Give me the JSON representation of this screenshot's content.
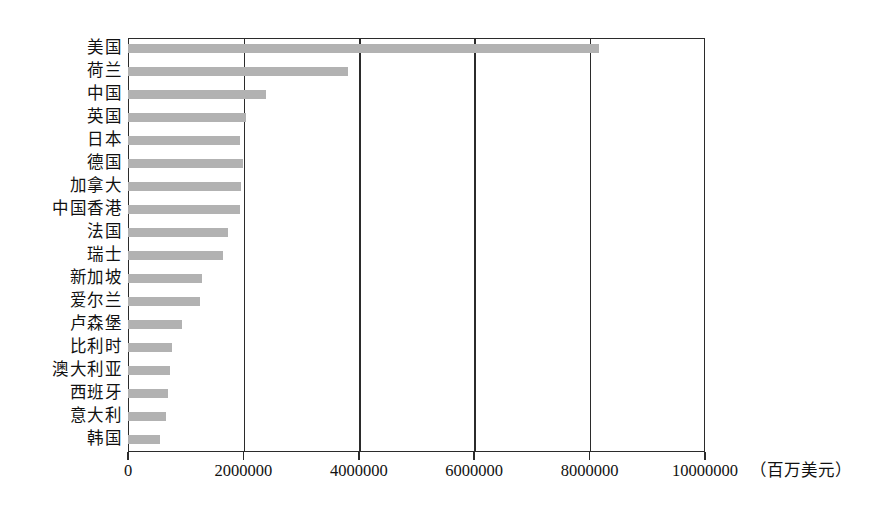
{
  "chart_data": {
    "type": "bar",
    "orientation": "horizontal",
    "title": "",
    "subtitle": "",
    "xlabel": "（百万美元）",
    "ylabel": "",
    "xlim": [
      0,
      10000000
    ],
    "xticks": [
      0,
      2000000,
      4000000,
      6000000,
      8000000,
      10000000
    ],
    "xtick_labels": [
      "0",
      "2000000",
      "4000000",
      "6000000",
      "8000000",
      "10000000"
    ],
    "unit_label": "（百万美元）",
    "grid": "vertical",
    "legend": null,
    "bar_color": "#b2b2b2",
    "axis_color": "#2b2b2b",
    "categories": [
      "美国",
      "荷兰",
      "中国",
      "英国",
      "日本",
      "德国",
      "加拿大",
      "中国香港",
      "法国",
      "瑞士",
      "新加坡",
      "爱尔兰",
      "卢森堡",
      "比利时",
      "澳大利亚",
      "西班牙",
      "意大利",
      "韩国"
    ],
    "values": [
      8170000,
      3810000,
      2390000,
      2040000,
      1940000,
      1990000,
      1960000,
      1940000,
      1730000,
      1640000,
      1280000,
      1250000,
      930000,
      760000,
      730000,
      690000,
      660000,
      560000
    ]
  }
}
